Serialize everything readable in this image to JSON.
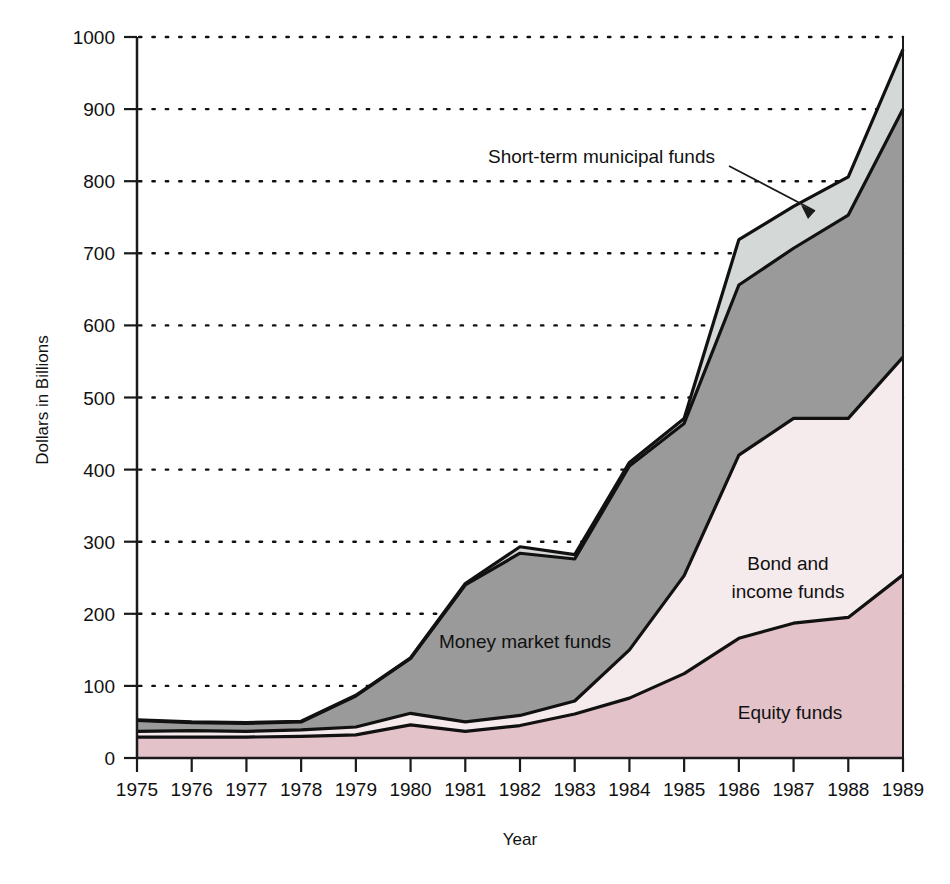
{
  "chart_data": {
    "type": "area",
    "stacked": true,
    "title": "",
    "xlabel": "Year",
    "ylabel": "Dollars in Billions",
    "categories": [
      1975,
      1976,
      1977,
      1978,
      1979,
      1980,
      1981,
      1982,
      1983,
      1984,
      1985,
      1986,
      1987,
      1988,
      1989
    ],
    "xlim": [
      1975,
      1989
    ],
    "ylim": [
      0,
      1000
    ],
    "ytick_labels": [
      "0",
      "100",
      "200",
      "300",
      "400",
      "500",
      "600",
      "700",
      "800",
      "900",
      "1000"
    ],
    "ytick_values": [
      0,
      100,
      200,
      300,
      400,
      500,
      600,
      700,
      800,
      900,
      1000
    ],
    "xtick_labels": [
      "1975",
      "1976",
      "1977",
      "1978",
      "1979",
      "1980",
      "1981",
      "1982",
      "1983",
      "1984",
      "1985",
      "1986",
      "1987",
      "1988",
      "1989"
    ],
    "grid": "horizontal-dotted",
    "legend": "inline-labels",
    "series": [
      {
        "name": "Equity funds",
        "color": "#e3c3c9",
        "label_position": {
          "x": 790,
          "y": 713
        },
        "values": [
          29,
          29,
          29,
          30,
          32,
          46,
          37,
          45,
          61,
          83,
          117,
          166,
          187,
          195,
          254
        ]
      },
      {
        "name": "Bond and income funds",
        "color": "#f6ebec",
        "label_position": {
          "x": 788,
          "y": 570
        },
        "label_lines": [
          "Bond and",
          "income funds"
        ],
        "values": [
          8,
          9,
          8,
          9,
          11,
          16,
          13,
          14,
          18,
          67,
          136,
          254,
          284,
          276,
          302
        ]
      },
      {
        "name": "Money market funds",
        "color": "#9a9a9a",
        "label_position": {
          "x": 525,
          "y": 648
        },
        "values": [
          15,
          11,
          11,
          11,
          43,
          76,
          190,
          225,
          197,
          255,
          211,
          236,
          236,
          282,
          344
        ]
      },
      {
        "name": "Short-term municipal funds",
        "color": "#d4d8d6",
        "label_position": {
          "x": 818,
          "y": 158
        },
        "callout_text_anchor": {
          "x": 712,
          "y": 158
        },
        "callout_arrow_from": {
          "x": 727,
          "y": 163
        },
        "callout_arrow_to": {
          "x": 822,
          "y": 218
        },
        "values": [
          1,
          1,
          1,
          1,
          1,
          1,
          2,
          9,
          6,
          5,
          7,
          63,
          58,
          53,
          83
        ]
      }
    ],
    "cumulative_tops": {
      "equity": [
        29,
        29,
        29,
        30,
        32,
        46,
        37,
        45,
        61,
        83,
        117,
        166,
        187,
        195,
        254
      ],
      "bond": [
        37,
        38,
        37,
        39,
        43,
        62,
        50,
        59,
        79,
        150,
        253,
        420,
        471,
        471,
        556
      ],
      "money_market": [
        52,
        49,
        48,
        50,
        86,
        138,
        240,
        284,
        276,
        405,
        464,
        656,
        707,
        753,
        900
      ],
      "total": [
        53,
        50,
        49,
        51,
        87,
        139,
        242,
        293,
        282,
        410,
        471,
        719,
        765,
        806,
        983
      ]
    }
  },
  "axes": {
    "ylabel": "Dollars in Billions",
    "xlabel": "Year"
  }
}
